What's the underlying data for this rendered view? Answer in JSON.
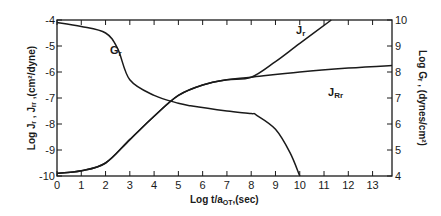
{
  "chart_data": {
    "type": "line",
    "title": "",
    "xlabel": "Log t/a_OT, (sec)",
    "ylabel_left": "Log J_r, J_Rr, (cm²/dyne)",
    "ylabel_right": "Log G_r, (dynes/cm²)",
    "xlim": [
      0,
      13.8
    ],
    "ylim_left": [
      -10,
      -4
    ],
    "ylim_right": [
      4,
      10
    ],
    "x_ticks": [
      "0",
      "1",
      "2",
      "3",
      "4",
      "5",
      "6",
      "7",
      "8",
      "9",
      "10",
      "11",
      "12",
      "13"
    ],
    "y_left_ticks": [
      "-4",
      "-5",
      "-6",
      "-7",
      "-8",
      "-9",
      "-10"
    ],
    "y_right_ticks": [
      "10",
      "9",
      "8",
      "7",
      "6",
      "5",
      "4"
    ],
    "grid": false,
    "legend": "inline curve labels",
    "series": [
      {
        "name": "G_r",
        "axis": "right",
        "x": [
          0,
          1,
          2,
          2.5,
          3,
          4,
          5,
          5.5,
          7,
          8,
          8.2,
          9,
          9.6,
          10
        ],
        "y": [
          9.9,
          9.75,
          9.5,
          8.9,
          7.7,
          7.1,
          6.8,
          6.7,
          6.5,
          6.4,
          6.35,
          5.8,
          4.9,
          4.0
        ],
        "label": "Gr"
      },
      {
        "name": "J_r",
        "axis": "left",
        "x": [
          0,
          1,
          2,
          3,
          4,
          5,
          6,
          7,
          8,
          9,
          10,
          11.3
        ],
        "y": [
          -9.9,
          -9.8,
          -9.5,
          -8.6,
          -7.7,
          -6.9,
          -6.5,
          -6.3,
          -6.2,
          -5.6,
          -4.9,
          -4.0
        ],
        "label": "Jr"
      },
      {
        "name": "J_Rr",
        "axis": "left",
        "x": [
          0,
          1,
          2,
          3,
          4,
          5,
          6,
          7,
          8,
          10,
          12,
          13.8
        ],
        "y": [
          -9.9,
          -9.8,
          -9.5,
          -8.6,
          -7.7,
          -6.9,
          -6.5,
          -6.3,
          -6.2,
          -6.0,
          -5.85,
          -5.75
        ],
        "label": "JRr"
      }
    ]
  },
  "labels": {
    "curve_g": "G",
    "curve_g_sub": "r",
    "curve_j": "J",
    "curve_j_sub": "r",
    "curve_jr": "J",
    "curve_jr_sub": "Rr",
    "xlabel_main": "Log t/a",
    "xlabel_sub": "OT",
    "xlabel_tail": ",(sec)",
    "ylabel_left": "Log Jᵣ , Jᵣᵣ ,(cm²/dyne)",
    "ylabel_right": "Log  Gᵣ , (dynes/cm²)"
  }
}
